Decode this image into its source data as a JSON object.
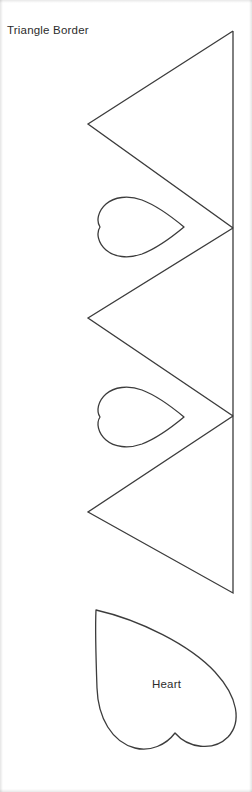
{
  "page": {
    "background_color": "#ffffff",
    "width": 252,
    "height": 792
  },
  "ink": {
    "stroke_color": "#3c3c3c",
    "stroke_width": 1.3,
    "fill": "none"
  },
  "labels": {
    "triangle_border": "Triangle Border",
    "heart": "Heart"
  },
  "shapes": {
    "triangle_border": {
      "name": "triangle-border-template",
      "label": "Triangle Border",
      "description": "Zigzag border strip: three left-pointing triangles sharing a vertical right edge",
      "spine": {
        "x": 233,
        "y_top": 31,
        "y_bottom": 593
      },
      "triangle_count": 3,
      "vertices_left": [
        {
          "x": 88,
          "y": 124
        },
        {
          "x": 88,
          "y": 318
        },
        {
          "x": 88,
          "y": 512
        }
      ],
      "vertices_right": [
        {
          "x": 233,
          "y": 31
        },
        {
          "x": 233,
          "y": 228
        },
        {
          "x": 233,
          "y": 416
        },
        {
          "x": 233,
          "y": 593
        }
      ],
      "path": "M 233 31 L 88 124 L 233 228 L 88 318 L 233 416 L 88 512 L 233 593 L 233 31"
    },
    "notch_hearts": [
      {
        "name": "notch-heart-1",
        "orientation": "rotated-left",
        "bbox": {
          "x": 95,
          "y": 198,
          "width": 90,
          "height": 58
        },
        "path": "M 184 227 C 172 237 155 249 142 254 C 128 259 114 257 106 250 C 98 243 96 233 100 227 C 96 221 98 211 106 204 C 114 197 128 195 142 200 C 155 205 172 217 184 227 Z"
      },
      {
        "name": "notch-heart-2",
        "orientation": "rotated-left",
        "bbox": {
          "x": 95,
          "y": 388,
          "width": 90,
          "height": 58
        },
        "path": "M 184 417 C 172 427 155 439 142 444 C 128 449 114 447 106 440 C 98 433 96 423 100 417 C 96 411 98 401 106 394 C 114 387 128 385 142 390 C 155 395 172 407 184 417 Z"
      }
    ],
    "large_heart": {
      "name": "large-heart-template",
      "label": "Heart",
      "orientation": "rotated",
      "bbox": {
        "x": 94,
        "y": 608,
        "width": 148,
        "height": 138
      },
      "point": {
        "x": 96,
        "y": 610
      },
      "path": "M 96 610 C 140 620 190 645 215 672 C 238 697 242 722 228 737 C 213 752 188 748 175 733 C 166 745 150 752 135 748 C 112 742 98 718 97 688 C 96 660 95 630 96 610 Z"
    }
  },
  "icons": {
    "triangle": "triangle-icon",
    "heart": "heart-icon"
  }
}
